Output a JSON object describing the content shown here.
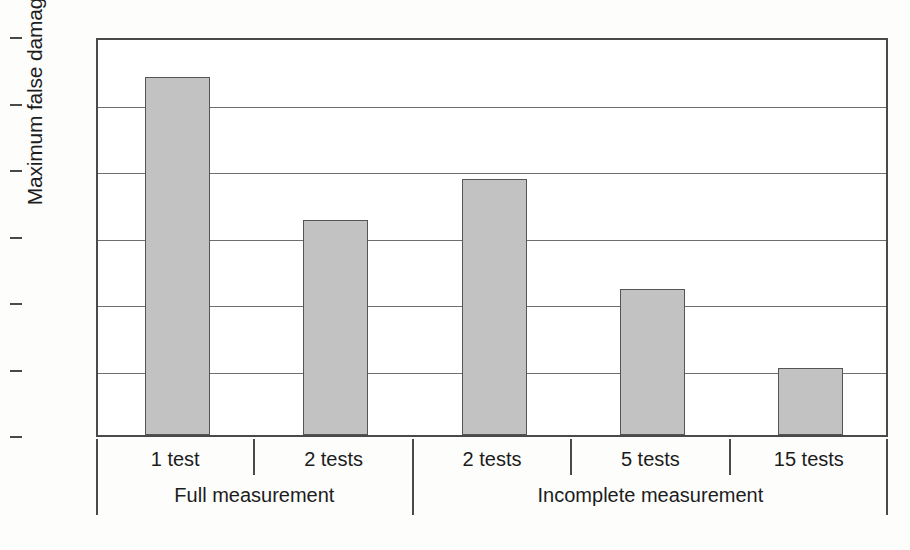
{
  "chart_data": {
    "type": "bar",
    "title": "",
    "xlabel": "",
    "ylabel": "Maximum false damage (%)",
    "ylim": [
      0,
      6
    ],
    "yticks": [
      0,
      1,
      2,
      3,
      4,
      5,
      6
    ],
    "categories": [
      "1 test",
      "2 tests",
      "2 tests",
      "5 tests",
      "15 tests"
    ],
    "values": [
      5.38,
      3.23,
      3.85,
      2.2,
      1.01
    ],
    "groups": [
      {
        "label": "Full measurement",
        "categories": [
          "1 test",
          "2 tests"
        ]
      },
      {
        "label": "Incomplete measurement",
        "categories": [
          "2 tests",
          "5 tests",
          "15 tests"
        ]
      }
    ],
    "grid": true,
    "legend": null,
    "bar_color": "#c2c2c2",
    "bar_edge_color": "#555555"
  },
  "axes": {
    "y_title": "Maximum false damage (%)",
    "y_tick_labels": [
      "6",
      "5",
      "4",
      "3",
      "2",
      "1",
      "0"
    ]
  },
  "x_axis": {
    "category_labels": [
      "1 test",
      "2 tests",
      "2 tests",
      "5 tests",
      "15 tests"
    ],
    "group_labels": [
      "Full measurement",
      "Incomplete measurement"
    ]
  },
  "caption": {
    "text": ""
  }
}
